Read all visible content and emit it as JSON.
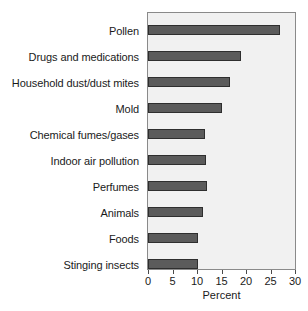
{
  "chart_data": {
    "type": "bar",
    "orientation": "horizontal",
    "title": "",
    "xlabel": "Percent",
    "ylabel": "",
    "xlim": [
      0,
      30
    ],
    "xticks": [
      0,
      5,
      10,
      15,
      20,
      25,
      30
    ],
    "xtick_labels": [
      "0",
      "5",
      "10",
      "15",
      "20",
      "25",
      "30"
    ],
    "grid": false,
    "legend": "none",
    "categories": [
      "Pollen",
      "Drugs and medications",
      "Household dust/dust mites",
      "Mold",
      "Chemical fumes/gases",
      "Indoor air pollution",
      "Perfumes",
      "Animals",
      "Foods",
      "Stinging insects"
    ],
    "values": [
      27,
      19,
      16.7,
      15,
      11.7,
      11.9,
      12,
      11.2,
      10.2,
      10.2
    ],
    "bar_color": "#5b5b5b",
    "bar_edge_color": "#2e2e2e",
    "plot_background": "#f1f1f1",
    "axis_color": "#8a8a8a",
    "text_color": "#1a1a1a"
  }
}
